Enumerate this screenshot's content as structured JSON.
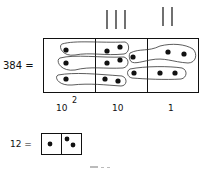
{
  "figure": {
    "main_equation_label": "384 =",
    "place_value_labels": [
      {
        "base": "10",
        "exponent": "2"
      },
      {
        "base": "10",
        "exponent": ""
      },
      {
        "base": "1",
        "exponent": ""
      }
    ],
    "tally_groups": [
      {
        "column": "tens",
        "count": 3
      },
      {
        "column": "ones",
        "count": 2
      }
    ],
    "columns": [
      {
        "name": "hundreds",
        "dots": 3,
        "groups": 3
      },
      {
        "name": "tens",
        "dots": 6,
        "groups": 3
      },
      {
        "name": "ones",
        "dots": 7,
        "groups": 2
      }
    ],
    "small_equation_label": "12 =",
    "small_columns": [
      {
        "name": "tens",
        "dots": 1
      },
      {
        "name": "ones",
        "dots": 2
      }
    ],
    "caption_fragment": "..."
  }
}
